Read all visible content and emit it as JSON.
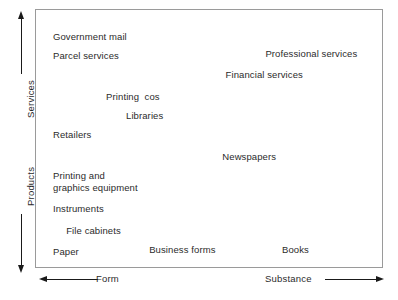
{
  "chart_data": {
    "type": "scatter",
    "title": "",
    "subtitle": "",
    "xlabel": "",
    "ylabel": "",
    "xlim": [
      0,
      100
    ],
    "ylim": [
      0,
      100
    ],
    "grid": false,
    "legend": null,
    "axes": {
      "vertical": {
        "upper": {
          "label": "Services",
          "arrow": "up",
          "arrow_icon": "arrow-up-icon"
        },
        "lower": {
          "label": "Products",
          "arrow": "down",
          "arrow_icon": "arrow-down-icon"
        }
      },
      "horizontal": {
        "left": {
          "label": "Form",
          "arrow": "left",
          "arrow_icon": "arrow-left-icon"
        },
        "right": {
          "label": "Substance",
          "arrow": "right",
          "arrow_icon": "arrow-right-icon"
        }
      }
    },
    "points": [
      {
        "label": "Government mail",
        "x": 3,
        "y": 95
      },
      {
        "label": "Parcel services",
        "x": 3,
        "y": 87
      },
      {
        "label": "Professional services",
        "x": 67,
        "y": 88
      },
      {
        "label": "Financial services",
        "x": 55,
        "y": 79
      },
      {
        "label": "Printing  cos",
        "x": 19,
        "y": 70
      },
      {
        "label": "Libraries",
        "x": 25,
        "y": 62
      },
      {
        "label": "Retailers",
        "x": 3,
        "y": 54
      },
      {
        "label": "Newspapers",
        "x": 54,
        "y": 45
      },
      {
        "label": "Printing and\ngraphics equipment",
        "x": 3,
        "y": 37
      },
      {
        "label": "Instruments",
        "x": 3,
        "y": 23
      },
      {
        "label": "File cabinets",
        "x": 7,
        "y": 14
      },
      {
        "label": "Business forms",
        "x": 32,
        "y": 6
      },
      {
        "label": "Books",
        "x": 72,
        "y": 6
      },
      {
        "label": "Paper",
        "x": 3,
        "y": 5
      }
    ]
  },
  "colors": {
    "background": "#ffffff",
    "frame": "#9a9a9a",
    "text": "#2b2b2b",
    "arrow": "#1a1a1a"
  }
}
